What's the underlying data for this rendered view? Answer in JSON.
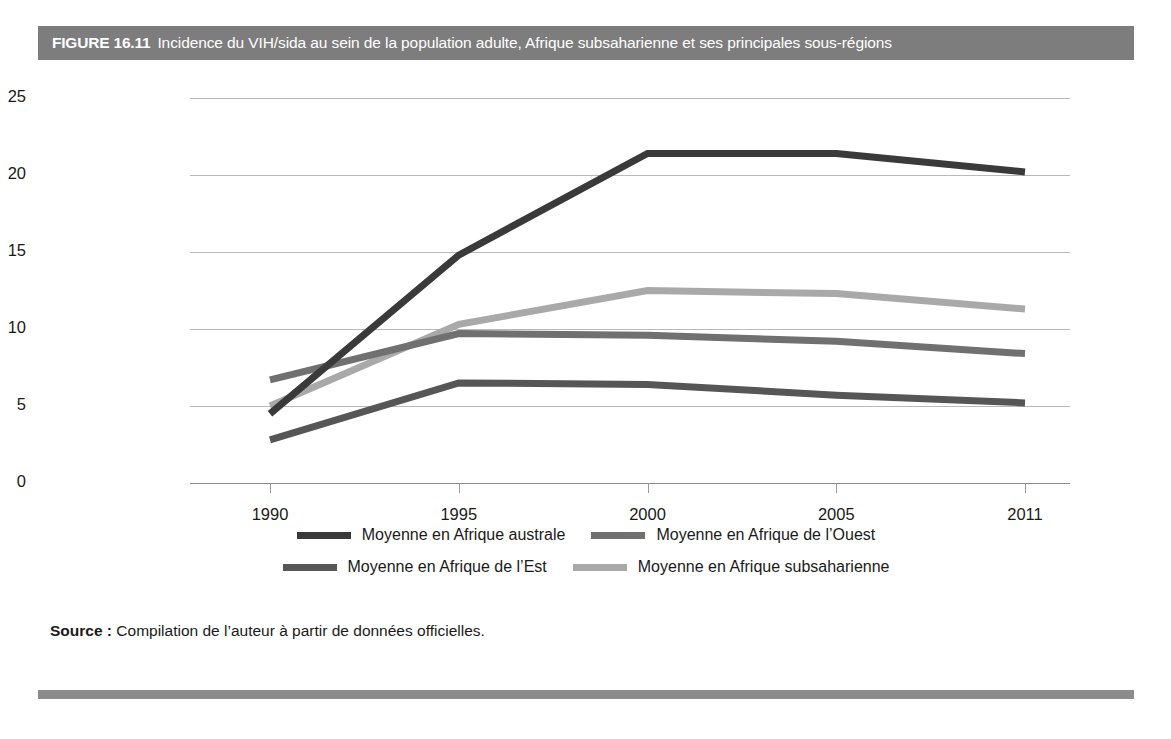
{
  "header": {
    "label": "FIGURE 16.11",
    "title": "Incidence du VIH/sida au sein de la population adulte, Afrique subsaharienne et ses principales sous-régions"
  },
  "source": {
    "label": "Source :",
    "text": "Compilation de l’auteur à partir de données officielles."
  },
  "colors": {
    "australe": "#3a3a3a",
    "ouest": "#707070",
    "est": "#565656",
    "subsaharienne": "#a9a9a9",
    "grid": "#b9b9b9",
    "header_bar": "#7d7d7d",
    "bottom_rule": "#8c8c8c"
  },
  "chart_data": {
    "type": "line",
    "title": "Incidence du VIH/sida au sein de la population adulte, Afrique subsaharienne et ses principales sous-régions",
    "xlabel": "",
    "ylabel": "",
    "x": [
      "1990",
      "1995",
      "2000",
      "2005",
      "2011"
    ],
    "ylim": [
      0,
      25
    ],
    "yticks": [
      0,
      5,
      10,
      15,
      20,
      25
    ],
    "grid": true,
    "legend_position": "bottom",
    "series": [
      {
        "name": "Moyenne en Afrique australe",
        "color": "#3a3a3a",
        "values": [
          4.5,
          14.8,
          21.4,
          21.4,
          20.2
        ]
      },
      {
        "name": "Moyenne en Afrique de l’Ouest",
        "color": "#707070",
        "values": [
          6.7,
          9.7,
          9.6,
          9.2,
          8.4
        ]
      },
      {
        "name": "Moyenne en Afrique de l’Est",
        "color": "#565656",
        "values": [
          2.8,
          6.5,
          6.4,
          5.7,
          5.2
        ]
      },
      {
        "name": "Moyenne en Afrique subsaharienne",
        "color": "#a9a9a9",
        "values": [
          5.0,
          10.3,
          12.5,
          12.3,
          11.3
        ]
      }
    ]
  },
  "legend": {
    "rows": [
      [
        {
          "label": "Moyenne en Afrique australe",
          "color": "#3a3a3a"
        },
        {
          "label": "Moyenne en Afrique de l’Ouest",
          "color": "#707070"
        }
      ],
      [
        {
          "label": "Moyenne en Afrique de l’Est",
          "color": "#565656"
        },
        {
          "label": "Moyenne en Afrique subsaharienne",
          "color": "#a9a9a9"
        }
      ]
    ]
  }
}
